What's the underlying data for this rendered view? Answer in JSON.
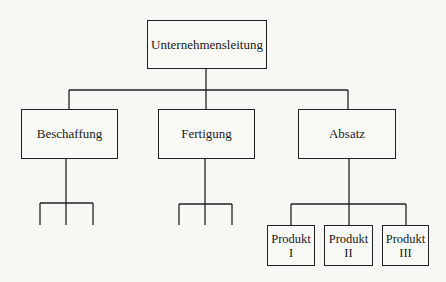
{
  "diagram": {
    "type": "organization-chart",
    "root": {
      "label": "Unternehmensleitung"
    },
    "departments": [
      {
        "label": "Beschaffung",
        "children_unlabeled": 3
      },
      {
        "label": "Fertigung",
        "children_unlabeled": 3
      },
      {
        "label": "Absatz",
        "children": [
          {
            "line1": "Produkt",
            "line2": "I"
          },
          {
            "line1": "Produkt",
            "line2": "II"
          },
          {
            "line1": "Produkt",
            "line2": "III"
          }
        ]
      }
    ],
    "colors": {
      "line": "#222222",
      "background": "#f7f7f4"
    }
  }
}
